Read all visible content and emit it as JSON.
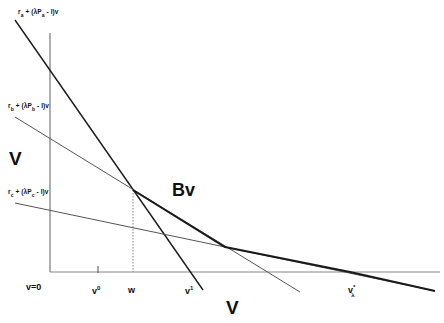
{
  "diagram": {
    "axes": {
      "y_label": "V",
      "x_label": "V",
      "origin_label": "v=0"
    },
    "line_labels": {
      "a": {
        "r": "r",
        "sub": "a",
        "plus": " + (",
        "mid": "λP",
        "close": " - I)v"
      },
      "b": {
        "r": "r",
        "sub": "b",
        "plus": " + (",
        "mid": "λP",
        "close": " - I)v"
      },
      "c": {
        "r": "r",
        "sub": "c",
        "plus": " + (",
        "mid": "λP",
        "close": " - I)v"
      }
    },
    "x_ticks": {
      "v0": {
        "base": "v",
        "sup": "0"
      },
      "w": {
        "base": "w"
      },
      "v1": {
        "base": "v",
        "sup": "1"
      },
      "vstar": {
        "base": "v",
        "sup": "*",
        "sub": "λ"
      }
    },
    "envelope_label": "Bv",
    "colors": {
      "line": "#1a1a1a",
      "thin_line": "#555555",
      "axis": "#777777",
      "background": "#ffffff"
    }
  }
}
